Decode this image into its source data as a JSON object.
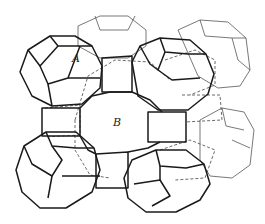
{
  "figure": {
    "type": "zeolite framework line drawing",
    "labels": {
      "a": "A",
      "b": "B"
    }
  }
}
